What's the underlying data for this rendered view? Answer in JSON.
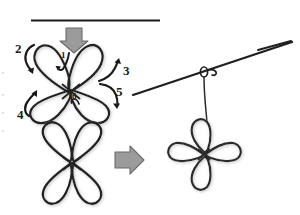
{
  "diagram": {
    "type": "hand-drawn instructional diagram",
    "colors": {
      "ink": "#1a1a1a",
      "stroke_dark": "#262626",
      "arrow_gray_fill": "#9b9b9b",
      "arrow_gray_stroke": "#6e6e6e",
      "background": "#ffffff",
      "shadow": "#c9c9c9"
    },
    "step_labels": [
      {
        "id": "label-1",
        "text": "1",
        "position": "inside top-center of upper flower",
        "size": "small"
      },
      {
        "id": "label-2",
        "text": "2",
        "position": "upper-left of upper flower",
        "size": "large"
      },
      {
        "id": "label-3",
        "text": "3",
        "position": "upper-right of upper flower",
        "size": "large"
      },
      {
        "id": "label-4",
        "text": "4",
        "position": "lower-left of upper flower",
        "size": "large"
      },
      {
        "id": "label-5",
        "text": "5",
        "position": "lower-right of upper flower",
        "size": "large"
      },
      {
        "id": "label-6",
        "text": "6",
        "position": "inside bottom-center of upper flower",
        "size": "small"
      }
    ],
    "elements": {
      "top_rule": "horizontal straight rule across top",
      "down_arrow": "gray block arrow pointing down onto upper flower",
      "right_arrow": "gray block arrow pointing right from lower-left flower",
      "upper_flower": "four-petal loop flower, petals in X orientation, with six motion arrows",
      "lower_flower": "four-petal loop flower, petals in X orientation, finished",
      "diagonal_line": "long straight line rising to the right (hanging wire / branch)",
      "knot": "small loop knot where hanging string meets the diagonal line",
      "hanging_string": "vertical string from knot down to flower",
      "hanging_flower": "four-petal loop flower in plus orientation hanging from string"
    },
    "motion_arrows": [
      {
        "for": "2",
        "direction": "curving down and to the left"
      },
      {
        "for": "3",
        "direction": "curving up and to the right"
      },
      {
        "for": "4",
        "direction": "curving up and to the left"
      },
      {
        "for": "5",
        "direction": "curving down and to the right"
      },
      {
        "for": "1",
        "direction": "short hook tucking inward at top center"
      },
      {
        "for": "6",
        "direction": "short hook tucking inward at bottom center"
      }
    ]
  }
}
